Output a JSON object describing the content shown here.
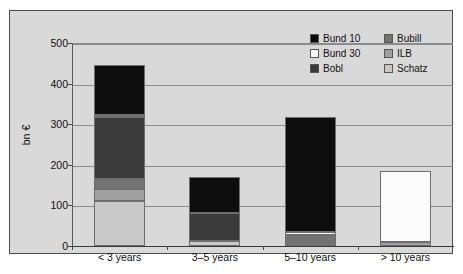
{
  "chart_data": {
    "type": "bar",
    "stacked": true,
    "title": "",
    "xlabel": "",
    "ylabel": "bn €",
    "ylim": [
      0,
      500
    ],
    "yticks": [
      0,
      100,
      200,
      300,
      400,
      500
    ],
    "ytick_labels": [
      "0",
      "100",
      "200",
      "300",
      "400",
      "500"
    ],
    "grid": true,
    "legend_position": "top-right",
    "categories": [
      "< 3 years",
      "3–5 years",
      "5–10 years",
      "> 10 years"
    ],
    "series": [
      {
        "name": "Bund 10",
        "color": "#0d0d0d",
        "values": [
          125,
          89,
          284,
          0
        ]
      },
      {
        "name": "Bund 30",
        "color": "#fbfbfb",
        "values": [
          5,
          0,
          6,
          175
        ]
      },
      {
        "name": "Bobl",
        "color": "#3a3a3a",
        "values": [
          152,
          68,
          0,
          0
        ]
      },
      {
        "name": "Bubill",
        "color": "#737373",
        "values": [
          25,
          0,
          28,
          0
        ]
      },
      {
        "name": "ILB",
        "color": "#a0a0a0",
        "values": [
          30,
          0,
          0,
          10
        ]
      },
      {
        "name": "Schatz",
        "color": "#c9c9c9",
        "values": [
          110,
          13,
          0,
          0
        ]
      }
    ],
    "stack_order": [
      "Schatz",
      "ILB",
      "Bubill",
      "Bobl",
      "Bund 30",
      "Bund 10"
    ],
    "totals": [
      447,
      170,
      318,
      185
    ]
  },
  "legend": {
    "entries": [
      {
        "label": "Bund 10",
        "color": "#0d0d0d"
      },
      {
        "label": "Bund 30",
        "color": "#fbfbfb"
      },
      {
        "label": "Bobl",
        "color": "#3a3a3a"
      },
      {
        "label": "Bubill",
        "color": "#737373"
      },
      {
        "label": "ILB",
        "color": "#a0a0a0"
      },
      {
        "label": "Schatz",
        "color": "#c9c9c9"
      }
    ]
  },
  "colors": {
    "plate_background": "#d9d9d9",
    "page_background": "#ffffff",
    "gridline": "#8a8a8a",
    "axis": "#3a3a3a",
    "text": "#111111"
  }
}
